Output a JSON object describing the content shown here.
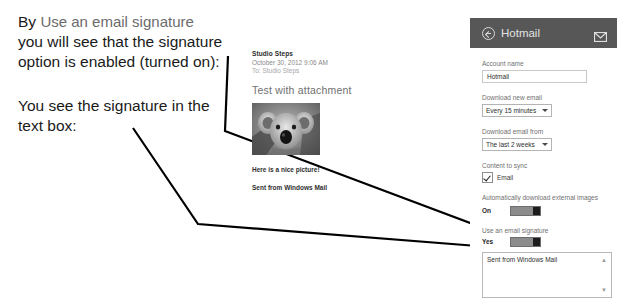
{
  "annotation": {
    "line1_prefix": "By",
    "line1_quoted": "Use an email signature",
    "line2": "you will see that the signature",
    "line3": "option is enabled (turned on):",
    "line4": "You see the signature in the",
    "line5": "text box:"
  },
  "email_preview": {
    "sender": "Studio Steps",
    "date": "October 30, 2012  9:06 AM",
    "to": "To: Studio Steps",
    "subject": "Test with attachment",
    "photo_icon": "koala-photo",
    "body": "Here is a nice picture!",
    "signature": "Sent from Windows Mail"
  },
  "settings": {
    "back_icon": "back-arrow-icon",
    "title": "Hotmail",
    "envelope_icon": "envelope-icon",
    "account_name_label": "Account name",
    "account_name_value": "Hotmail",
    "download_new_email_label": "Download new email",
    "download_new_email_value": "Every 15 minutes",
    "download_email_from_label": "Download email from",
    "download_email_from_value": "The last 2 weeks",
    "content_to_sync_label": "Content to sync",
    "content_to_sync_item": "Email",
    "auto_download_label": "Automatically download external images",
    "auto_download_state": "On",
    "use_signature_label": "Use an email signature",
    "use_signature_state": "Yes",
    "signature_text": "Sent from Windows Mail",
    "scroll_up_icon": "chevron-up-icon",
    "scroll_down_icon": "chevron-down-icon"
  },
  "colors": {
    "header_bg": "#575757",
    "toggle_track": "#8c8c8c",
    "toggle_thumb": "#1c1c1c",
    "leader_line": "#000000",
    "quoted_text": "#6b6b6b"
  }
}
